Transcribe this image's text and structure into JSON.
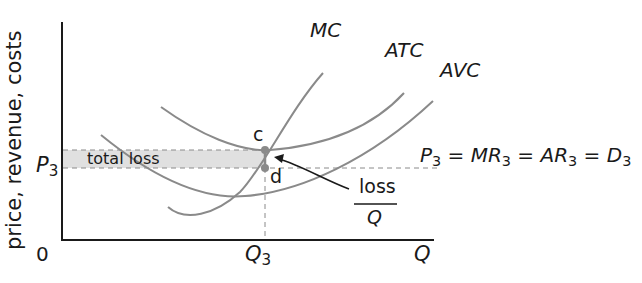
{
  "diagram": {
    "title": "",
    "y_axis_label": "price, revenue, costs",
    "x_axis_label": "Q",
    "origin_label": "0",
    "q3_label": "Q",
    "q3_sub": "3",
    "p3_label": "P",
    "p3_sub": "3",
    "curves": {
      "mc": "MC",
      "atc": "ATC",
      "avc": "AVC"
    },
    "points": {
      "c": "c",
      "d": "d"
    },
    "shaded_region_label": "total loss",
    "loss_per_unit": {
      "numerator": "loss",
      "denominator": "Q"
    },
    "demand_line": {
      "parts": [
        "P",
        "3",
        " = ",
        "MR",
        "3",
        " = ",
        "AR",
        "3",
        " = ",
        "D",
        "3"
      ]
    },
    "colors": {
      "curve": "#8a8a8a",
      "axis": "#1a1a1a",
      "shade": "#e0e0e0",
      "dash": "#8a8a8a",
      "point": "#8a8a8a"
    }
  }
}
